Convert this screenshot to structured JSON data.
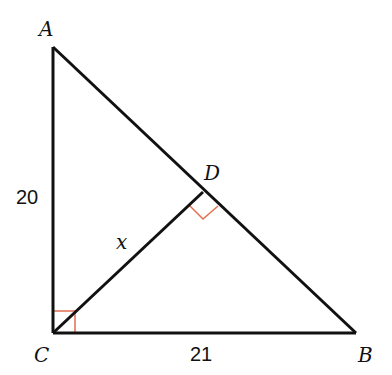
{
  "diagram": {
    "type": "right-triangle-with-altitude",
    "vertices": {
      "A": {
        "label": "A",
        "x": 53,
        "y": 47
      },
      "B": {
        "label": "B",
        "x": 356,
        "y": 333
      },
      "C": {
        "label": "C",
        "x": 53,
        "y": 333
      },
      "D": {
        "label": "D",
        "x": 203,
        "y": 192
      }
    },
    "labels": {
      "A": "A",
      "B": "B",
      "C": "C",
      "D": "D",
      "side_AC": "20",
      "side_CB": "21",
      "segment_CD": "x"
    },
    "right_angles": [
      "C",
      "D"
    ],
    "colors": {
      "line": "#111111",
      "right_angle_marker": "#e07050"
    }
  }
}
